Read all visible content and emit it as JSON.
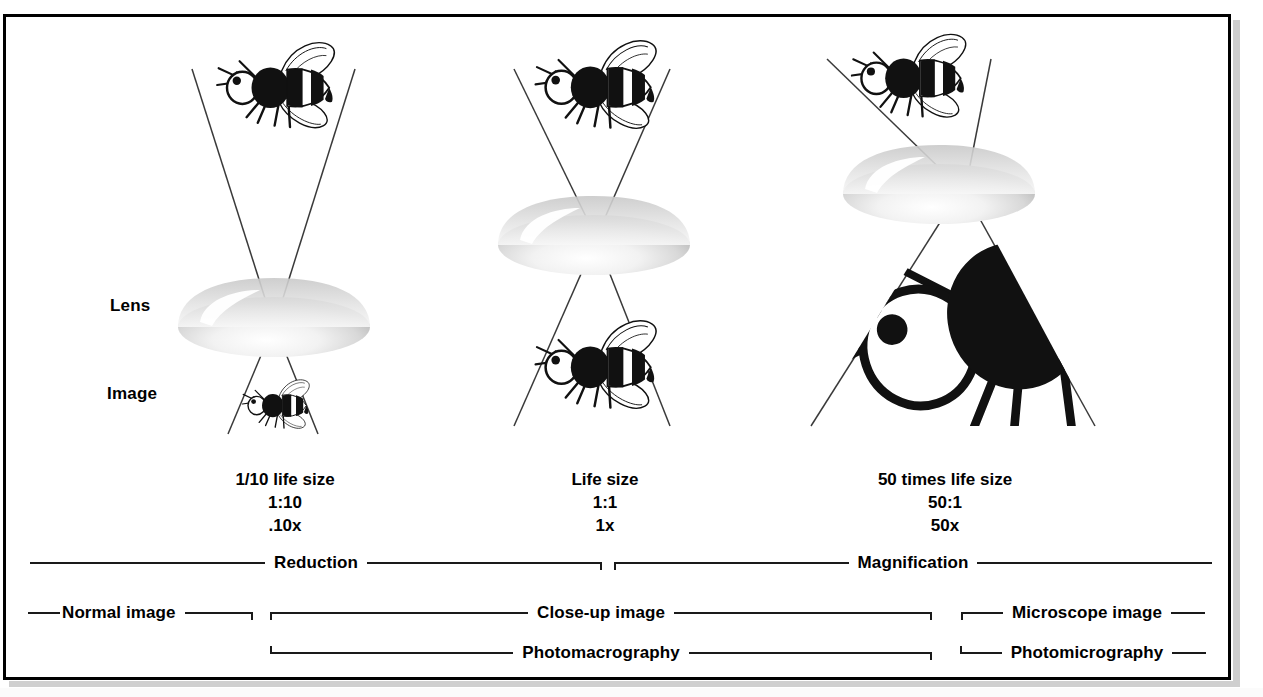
{
  "diagram": {
    "axis_labels": {
      "lens": "Lens",
      "image": "Image"
    },
    "columns": [
      {
        "id": "reduction-column",
        "size_text": "1/10 life size",
        "ratio": "1:10",
        "factor": ".10x",
        "subject_icon": "bee-icon",
        "lens_icon": "lens-icon",
        "image_icon": "bee-icon-small"
      },
      {
        "id": "life-size-column",
        "size_text": "Life size",
        "ratio": "1:1",
        "factor": "1x",
        "subject_icon": "bee-icon",
        "lens_icon": "lens-icon",
        "image_icon": "bee-icon"
      },
      {
        "id": "magnification-column",
        "size_text": "50 times life size",
        "ratio": "50:1",
        "factor": "50x",
        "subject_icon": "bee-icon",
        "lens_icon": "lens-icon",
        "image_icon": "bee-icon-large"
      }
    ],
    "bracket_rows": [
      {
        "id": "scale-row",
        "brackets": [
          {
            "label": "Reduction"
          },
          {
            "label": "Magnification"
          }
        ]
      },
      {
        "id": "image-type-row",
        "brackets": [
          {
            "label": "Normal image"
          },
          {
            "label": "Close-up image"
          },
          {
            "label": "Microscope image"
          }
        ]
      },
      {
        "id": "photography-row",
        "brackets": [
          {
            "label": "Photomacrography"
          },
          {
            "label": "Photomicrography"
          }
        ]
      }
    ],
    "colors": {
      "ink": "#000000",
      "rule": "#1a1a1a",
      "background": "#ffffff",
      "frame": "#000000",
      "page_shadow": "#cfcfcf"
    }
  }
}
